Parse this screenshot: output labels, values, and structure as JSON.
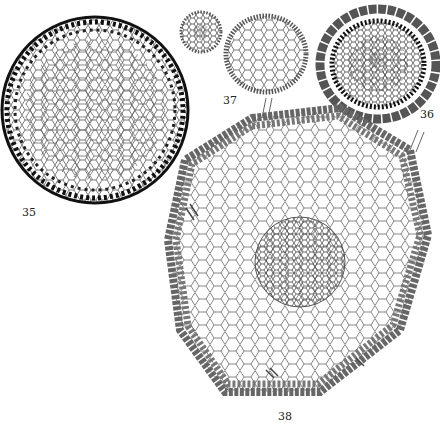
{
  "figures": [
    {
      "id": "fig-35",
      "label": "35",
      "description": "cross-section, large round, thick-walled outer cells"
    },
    {
      "id": "fig-36",
      "label": "36",
      "description": "cross-section with ring of large epidermal cells"
    },
    {
      "id": "fig-37",
      "label": "37",
      "description": "two small cross-sections"
    },
    {
      "id": "fig-38",
      "label": "38",
      "description": "large cross-section with central stele and root hairs"
    }
  ],
  "colors": {
    "ink": "#222222",
    "paper": "#ffffff"
  }
}
